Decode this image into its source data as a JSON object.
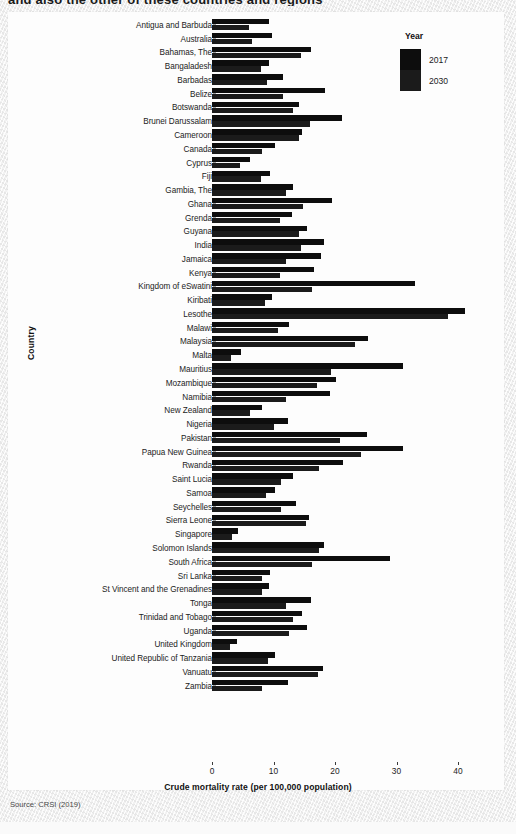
{
  "poster": {
    "top_title_fragment": "and also the other of these countries and regions",
    "source_note": "Source: CRSI (2019)"
  },
  "legend": {
    "title": "Year",
    "entries": [
      {
        "label": "2017",
        "color": "#0d0d0d"
      },
      {
        "label": "2030",
        "color": "#1b1b1b"
      }
    ]
  },
  "chart_data": {
    "type": "bar",
    "orientation": "horizontal",
    "title": "",
    "xlabel": "Crude mortality rate (per 100,000 population)",
    "ylabel": "Country",
    "xlim": [
      0,
      43
    ],
    "xticks": [
      0,
      10,
      20,
      30,
      40
    ],
    "grid": false,
    "legend_position": "top-right",
    "legend_title": "Year",
    "categories": [
      "Antigua and Barbuda",
      "Australia",
      "Bahamas, The",
      "Bangaladesh",
      "Barbadas",
      "Belize",
      "Botswanda",
      "Brunei Darussalam",
      "Cameroon",
      "Canada",
      "Cyprus",
      "Fiji",
      "Gambia, The",
      "Ghana",
      "Grenda",
      "Guyana",
      "India",
      "Jamaica",
      "Kenya",
      "Kingdom of eSwatini",
      "Kiribati",
      "Lesothe",
      "Malawi",
      "Malaysia",
      "Malta",
      "Mauritius",
      "Mozambique",
      "Namibia",
      "New Zealand",
      "Nigeria",
      "Pakistan",
      "Papua New Guinea",
      "Rwanda",
      "Saint Lucia",
      "Samoa",
      "Seychelles",
      "Sierra Leone",
      "Singapore",
      "Solomon Islands",
      "South Africa",
      "Sri Lanka",
      "St Vincent and the Grenadines",
      "Tonga",
      "Trinidad and Tobago",
      "Uganda",
      "United Kingdom",
      "United Republic of Tanzania",
      "Vanuatu",
      "Zambia"
    ],
    "series": [
      {
        "name": "2017",
        "color": "#0d0d0d",
        "values": [
          9.3,
          9.8,
          16.1,
          9.2,
          11.5,
          18.4,
          14.2,
          21.2,
          14.7,
          10.2,
          6.2,
          9.4,
          13.1,
          19.5,
          13.0,
          15.5,
          18.2,
          17.7,
          16.6,
          33.0,
          9.8,
          41.2,
          12.6,
          25.4,
          4.7,
          31.1,
          20.1,
          19.2,
          8.1,
          12.3,
          25.2,
          31.0,
          21.3,
          13.1,
          10.3,
          13.7,
          15.7,
          4.2,
          18.2,
          28.9,
          9.4,
          9.3,
          16.1,
          14.6,
          15.4,
          4.0,
          10.2,
          18.1,
          12.3
        ]
      },
      {
        "name": "2030",
        "color": "#1b1b1b",
        "values": [
          6.0,
          6.5,
          14.4,
          8.0,
          9.0,
          11.5,
          13.2,
          16.0,
          14.1,
          8.2,
          4.6,
          8.0,
          12.1,
          14.8,
          11.1,
          14.2,
          14.5,
          12.0,
          11.1,
          16.2,
          8.6,
          38.4,
          10.8,
          23.3,
          3.1,
          19.3,
          17.1,
          12.0,
          6.2,
          10.1,
          20.8,
          24.3,
          17.4,
          11.2,
          8.8,
          11.2,
          15.3,
          3.2,
          17.4,
          16.2,
          8.2,
          8.1,
          12.1,
          13.1,
          12.5,
          3.0,
          9.1,
          17.2,
          8.2
        ]
      }
    ]
  }
}
